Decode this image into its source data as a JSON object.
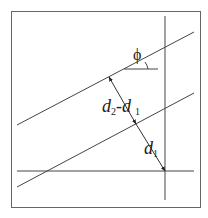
{
  "diagram": {
    "type": "geometry",
    "labels": {
      "angle": "ϕ",
      "upper_distance_main": "d",
      "upper_distance_sub2": "2",
      "upper_distance_dash": "-d",
      "upper_distance_sub1": "1",
      "lower_distance_main": "d",
      "lower_distance_sub1": "1"
    },
    "colors": {
      "line": "#333333",
      "frame": "#555555",
      "background": "#ffffff"
    },
    "elements": {
      "frame": {
        "x1": 11,
        "y1": 11,
        "x2": 201,
        "y2": 208
      },
      "vertical_line": {
        "x1": 165,
        "y1": 16,
        "x2": 165,
        "y2": 200
      },
      "horizontal_line": {
        "x1": 17,
        "y1": 171,
        "x2": 194,
        "y2": 171
      },
      "upper_incline": {
        "x1": 17,
        "y1": 125,
        "x2": 194,
        "y2": 32
      },
      "lower_incline": {
        "x1": 17,
        "y1": 187,
        "x2": 194,
        "y2": 93
      },
      "angle_reference": {
        "x1": 124,
        "y1": 69,
        "x2": 158,
        "y2": 69
      },
      "perpendicular": {
        "x1": 109,
        "y1": 77,
        "mx": 136,
        "my": 124,
        "x2": 165,
        "y2": 171
      }
    }
  }
}
